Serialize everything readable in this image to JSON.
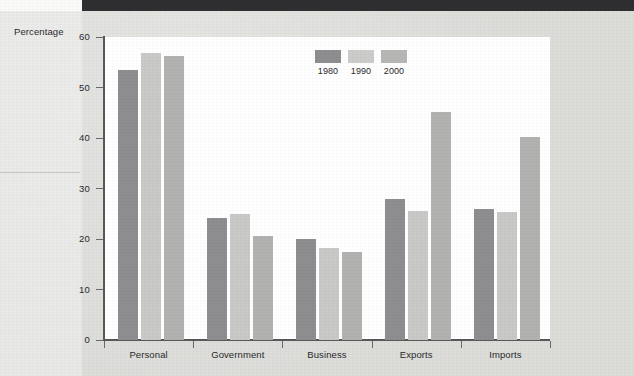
{
  "page": {
    "background_color": "#dcdcd9",
    "header_bar_color": "#2f2f31"
  },
  "chart_data": {
    "type": "bar",
    "title": "",
    "xlabel": "",
    "ylabel": "Percentage",
    "ylim": [
      0,
      60
    ],
    "yticks": [
      0,
      10,
      20,
      30,
      40,
      50,
      60
    ],
    "ytick_labels": [
      "0",
      "10",
      "20",
      "30",
      "40",
      "50",
      "60"
    ],
    "grid": false,
    "legend_position": "inside-top-center",
    "categories": [
      "Personal",
      "Government",
      "Business",
      "Exports",
      "Imports"
    ],
    "series": [
      {
        "name": "1980",
        "color": "#8e8e90",
        "values": [
          53.5,
          24.2,
          20.1,
          27.9,
          25.9
        ]
      },
      {
        "name": "1990",
        "color": "#c9c9c8",
        "values": [
          56.9,
          25.0,
          18.3,
          25.5,
          25.3
        ]
      },
      {
        "name": "2000",
        "color": "#b2b2b1",
        "values": [
          56.2,
          20.5,
          17.4,
          45.2,
          40.2
        ]
      }
    ],
    "legend": [
      {
        "label": "1980",
        "color": "#8e8e90"
      },
      {
        "label": "1990",
        "color": "#cccccb"
      },
      {
        "label": "2000",
        "color": "#b6b6b5"
      }
    ]
  }
}
